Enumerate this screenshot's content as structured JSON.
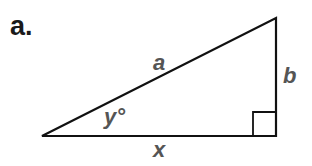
{
  "problem": {
    "label": "a."
  },
  "triangle": {
    "type": "right-triangle",
    "vertices": {
      "left": [
        42,
        136
      ],
      "bottom_right": [
        276,
        136
      ],
      "top_right": [
        276,
        18
      ]
    },
    "right_angle_marker": {
      "at": "bottom_right",
      "size": 23
    },
    "stroke_color": "#111111",
    "label_color": "#555555"
  },
  "labels": {
    "hypotenuse": "a",
    "vertical_leg": "b",
    "horizontal_leg": "x",
    "angle": "y°"
  }
}
